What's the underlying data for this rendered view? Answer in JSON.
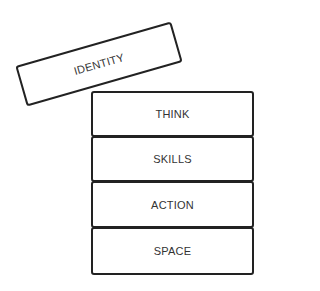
{
  "diagram": {
    "tilted_block": {
      "label": "IDENTITY"
    },
    "stack": [
      {
        "label": "THINK"
      },
      {
        "label": "SKILLS"
      },
      {
        "label": "ACTION"
      },
      {
        "label": "SPACE"
      }
    ]
  }
}
